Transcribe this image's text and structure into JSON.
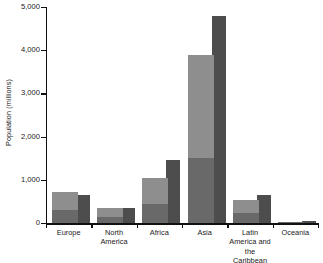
{
  "chart_data": {
    "type": "bar",
    "title": "",
    "xlabel": "",
    "ylabel": "Population (millions)",
    "ylim": [
      0,
      5000
    ],
    "yticks": [
      0,
      1000,
      2000,
      3000,
      4000,
      5000
    ],
    "ytick_labels": [
      "0",
      "1,000",
      "2,000",
      "3,000",
      "4,000",
      "5,000"
    ],
    "grid": false,
    "legend": "none",
    "categories": [
      "Europe",
      "North America",
      "Africa",
      "Asia",
      "Latin America and the Caribbean",
      "Oceania"
    ],
    "series": [
      {
        "name": "back-bar",
        "color": "#4d4d4d",
        "values": [
          650,
          350,
          1450,
          4800,
          650,
          50
        ]
      },
      {
        "name": "front-bar",
        "color": "#8e8e8e",
        "values": [
          720,
          345,
          1040,
          3900,
          530,
          35
        ],
        "lower_segment_color": "#696969",
        "lower_segment_values": [
          300,
          150,
          430,
          1500,
          230,
          15
        ]
      }
    ]
  },
  "axis": {
    "y_title": "Population (millions)"
  },
  "categories_display": [
    {
      "label": "Europe"
    },
    {
      "label": "North\nAmerica"
    },
    {
      "label": "Africa"
    },
    {
      "label": "Asia"
    },
    {
      "label": "Latin\nAmerica and\nthe Caribbean"
    },
    {
      "label": "Oceania"
    }
  ],
  "colors": {
    "back_bar": "#4d4d4d",
    "front_bar": "#8e8e8e",
    "front_bar_lower": "#696969",
    "axis": "#111111",
    "text": "#1a1a1a",
    "background": "#ffffff"
  }
}
